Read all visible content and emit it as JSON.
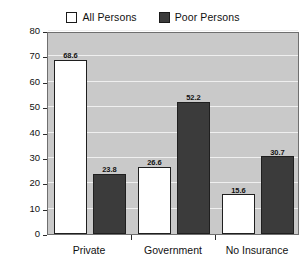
{
  "chart_data": {
    "type": "bar",
    "title": "",
    "subtitle": "",
    "xlabel": "",
    "ylabel": "",
    "categories": [
      "Private",
      "Government",
      "No Insurance"
    ],
    "series": [
      {
        "name": "All Persons",
        "color": "#ffffff",
        "values": [
          68.6,
          26.6,
          15.6
        ],
        "labels": [
          "68.6",
          "26.6",
          "15.6"
        ]
      },
      {
        "name": "Poor Persons",
        "color": "#3b3b3b",
        "values": [
          23.8,
          52.2,
          30.7
        ],
        "labels": [
          "23.8",
          "52.2",
          "30.7"
        ]
      }
    ],
    "ylim": [
      0,
      80
    ],
    "yticks": [
      0,
      10,
      20,
      30,
      40,
      50,
      60,
      70,
      80
    ],
    "ytick_labels": [
      "0",
      "10",
      "20",
      "30",
      "40",
      "50",
      "60",
      "70",
      "80"
    ],
    "grid": true,
    "grid_axis": "y",
    "legend_position": "top-center",
    "plot_background": "#c9c9c9",
    "gridline_color": "#efefef",
    "data_labels_shown": true
  },
  "legend": {
    "entries": [
      {
        "label": "All Persons",
        "swatch": "all"
      },
      {
        "label": "Poor Persons",
        "swatch": "poor"
      }
    ]
  }
}
